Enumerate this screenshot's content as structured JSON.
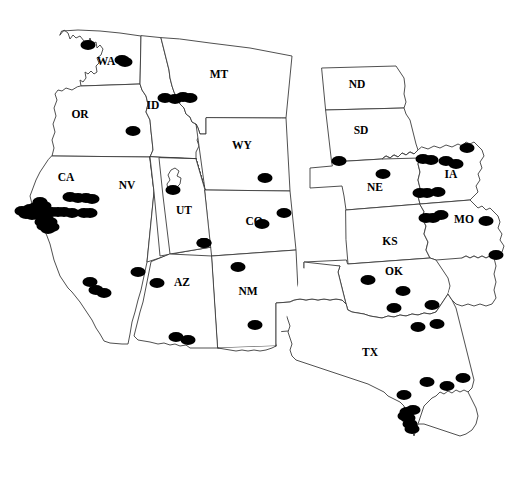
{
  "map": {
    "title": "Western United States occurrence distribution map",
    "width": 515,
    "height": 483,
    "background_color": "#ffffff",
    "border_color": "#3c3c3c",
    "dot_color": "#000000",
    "label_color": "#000000",
    "projection_note": "conic projection, western and central US states"
  },
  "chart_data": {
    "type": "scatter",
    "title": "",
    "xlabel": "",
    "ylabel": "",
    "coordinate_space": "image pixels, origin top-left, 515x483",
    "marker": {
      "shape": "ellipse",
      "color": "#000000",
      "radius_x": 7.5,
      "radius_y": 5.0
    },
    "states": [
      {
        "code": "WA",
        "name": "Washington",
        "label_x": 106,
        "label_y": 62,
        "dot_count": 2
      },
      {
        "code": "OR",
        "name": "Oregon",
        "label_x": 80,
        "label_y": 115,
        "dot_count": 1
      },
      {
        "code": "ID",
        "name": "Idaho",
        "label_x": 153,
        "label_y": 106,
        "dot_count": 3
      },
      {
        "code": "MT",
        "name": "Montana",
        "label_x": 219,
        "label_y": 75,
        "dot_count": 1
      },
      {
        "code": "WY",
        "name": "Wyoming",
        "label_x": 242,
        "label_y": 146,
        "dot_count": 1
      },
      {
        "code": "CA",
        "name": "California",
        "label_x": 66,
        "label_y": 178,
        "dot_count": 27
      },
      {
        "code": "NV",
        "name": "Nevada",
        "label_x": 127,
        "label_y": 186,
        "dot_count": 0
      },
      {
        "code": "UT",
        "name": "Utah",
        "label_x": 184,
        "label_y": 211,
        "dot_count": 1
      },
      {
        "code": "CO",
        "name": "Colorado",
        "label_x": 254,
        "label_y": 222,
        "dot_count": 2
      },
      {
        "code": "AZ",
        "name": "Arizona",
        "label_x": 182,
        "label_y": 283,
        "dot_count": 4
      },
      {
        "code": "NM",
        "name": "New Mexico",
        "label_x": 248,
        "label_y": 292,
        "dot_count": 2
      },
      {
        "code": "ND",
        "name": "North Dakota",
        "label_x": 357,
        "label_y": 85,
        "dot_count": 0
      },
      {
        "code": "SD",
        "name": "South Dakota",
        "label_x": 361,
        "label_y": 131,
        "dot_count": 0
      },
      {
        "code": "NE",
        "name": "Nebraska",
        "label_x": 375,
        "label_y": 188,
        "dot_count": 2
      },
      {
        "code": "IA",
        "name": "Iowa",
        "label_x": 451,
        "label_y": 175,
        "dot_count": 5
      },
      {
        "code": "MO",
        "name": "Missouri",
        "label_x": 464,
        "label_y": 220,
        "dot_count": 4
      },
      {
        "code": "KS",
        "name": "Kansas",
        "label_x": 390,
        "label_y": 242,
        "dot_count": 0
      },
      {
        "code": "OK",
        "name": "Oklahoma",
        "label_x": 394,
        "label_y": 272,
        "dot_count": 4
      },
      {
        "code": "TX",
        "name": "Texas",
        "label_x": 370,
        "label_y": 353,
        "dot_count": 16
      }
    ],
    "points": [
      {
        "x": 122,
        "y": 60,
        "state": "WA"
      },
      {
        "x": 125,
        "y": 62,
        "state": "WA"
      },
      {
        "x": 88,
        "y": 45,
        "state": "WA"
      },
      {
        "x": 133,
        "y": 131,
        "state": "OR"
      },
      {
        "x": 165,
        "y": 98,
        "state": "ID"
      },
      {
        "x": 175,
        "y": 99,
        "state": "ID"
      },
      {
        "x": 183,
        "y": 97,
        "state": "ID"
      },
      {
        "x": 190,
        "y": 98,
        "state": "MT"
      },
      {
        "x": 265,
        "y": 178,
        "state": "WY"
      },
      {
        "x": 262,
        "y": 224,
        "state": "CO"
      },
      {
        "x": 284,
        "y": 213,
        "state": "CO"
      },
      {
        "x": 173,
        "y": 190,
        "state": "UT"
      },
      {
        "x": 204,
        "y": 243,
        "state": "UT"
      },
      {
        "x": 84,
        "y": 213,
        "state": "CA"
      },
      {
        "x": 90,
        "y": 213,
        "state": "CA"
      },
      {
        "x": 72,
        "y": 213,
        "state": "CA"
      },
      {
        "x": 64,
        "y": 212,
        "state": "CA"
      },
      {
        "x": 58,
        "y": 212,
        "state": "CA"
      },
      {
        "x": 52,
        "y": 212,
        "state": "CA"
      },
      {
        "x": 45,
        "y": 213,
        "state": "CA"
      },
      {
        "x": 38,
        "y": 215,
        "state": "CA"
      },
      {
        "x": 32,
        "y": 215,
        "state": "CA"
      },
      {
        "x": 26,
        "y": 214,
        "state": "CA"
      },
      {
        "x": 44,
        "y": 206,
        "state": "CA"
      },
      {
        "x": 40,
        "y": 202,
        "state": "CA"
      },
      {
        "x": 36,
        "y": 207,
        "state": "CA"
      },
      {
        "x": 46,
        "y": 219,
        "state": "CA"
      },
      {
        "x": 50,
        "y": 222,
        "state": "CA"
      },
      {
        "x": 42,
        "y": 222,
        "state": "CA"
      },
      {
        "x": 52,
        "y": 227,
        "state": "CA"
      },
      {
        "x": 48,
        "y": 229,
        "state": "CA"
      },
      {
        "x": 44,
        "y": 226,
        "state": "CA"
      },
      {
        "x": 30,
        "y": 209,
        "state": "CA"
      },
      {
        "x": 22,
        "y": 211,
        "state": "CA"
      },
      {
        "x": 78,
        "y": 198,
        "state": "CA"
      },
      {
        "x": 86,
        "y": 198,
        "state": "CA"
      },
      {
        "x": 70,
        "y": 197,
        "state": "CA"
      },
      {
        "x": 92,
        "y": 199,
        "state": "CA"
      },
      {
        "x": 90,
        "y": 282,
        "state": "CA"
      },
      {
        "x": 96,
        "y": 290,
        "state": "CA"
      },
      {
        "x": 104,
        "y": 293,
        "state": "CA"
      },
      {
        "x": 138,
        "y": 272,
        "state": "CA"
      },
      {
        "x": 157,
        "y": 283,
        "state": "AZ"
      },
      {
        "x": 176,
        "y": 337,
        "state": "AZ"
      },
      {
        "x": 188,
        "y": 340,
        "state": "AZ"
      },
      {
        "x": 204,
        "y": 243,
        "state": "AZ"
      },
      {
        "x": 238,
        "y": 267,
        "state": "NM"
      },
      {
        "x": 255,
        "y": 325,
        "state": "NM"
      },
      {
        "x": 339,
        "y": 161,
        "state": "NE"
      },
      {
        "x": 383,
        "y": 174,
        "state": "NE"
      },
      {
        "x": 423,
        "y": 159,
        "state": "IA"
      },
      {
        "x": 431,
        "y": 160,
        "state": "IA"
      },
      {
        "x": 446,
        "y": 161,
        "state": "IA"
      },
      {
        "x": 456,
        "y": 164,
        "state": "IA"
      },
      {
        "x": 467,
        "y": 148,
        "state": "IA"
      },
      {
        "x": 420,
        "y": 193,
        "state": "IA"
      },
      {
        "x": 427,
        "y": 193,
        "state": "IA"
      },
      {
        "x": 438,
        "y": 192,
        "state": "IA"
      },
      {
        "x": 441,
        "y": 215,
        "state": "MO"
      },
      {
        "x": 433,
        "y": 218,
        "state": "MO"
      },
      {
        "x": 426,
        "y": 218,
        "state": "MO"
      },
      {
        "x": 486,
        "y": 221,
        "state": "MO"
      },
      {
        "x": 496,
        "y": 255,
        "state": "MO"
      },
      {
        "x": 368,
        "y": 280,
        "state": "OK"
      },
      {
        "x": 403,
        "y": 291,
        "state": "OK"
      },
      {
        "x": 394,
        "y": 308,
        "state": "OK"
      },
      {
        "x": 432,
        "y": 305,
        "state": "OK"
      },
      {
        "x": 418,
        "y": 327,
        "state": "TX"
      },
      {
        "x": 437,
        "y": 324,
        "state": "TX"
      },
      {
        "x": 427,
        "y": 382,
        "state": "TX"
      },
      {
        "x": 447,
        "y": 386,
        "state": "TX"
      },
      {
        "x": 463,
        "y": 378,
        "state": "TX"
      },
      {
        "x": 404,
        "y": 395,
        "state": "TX"
      },
      {
        "x": 407,
        "y": 412,
        "state": "TX"
      },
      {
        "x": 408,
        "y": 418,
        "state": "TX"
      },
      {
        "x": 410,
        "y": 424,
        "state": "TX"
      },
      {
        "x": 412,
        "y": 429,
        "state": "TX"
      },
      {
        "x": 405,
        "y": 416,
        "state": "TX"
      },
      {
        "x": 413,
        "y": 410,
        "state": "TX"
      }
    ],
    "total_points": 80
  }
}
